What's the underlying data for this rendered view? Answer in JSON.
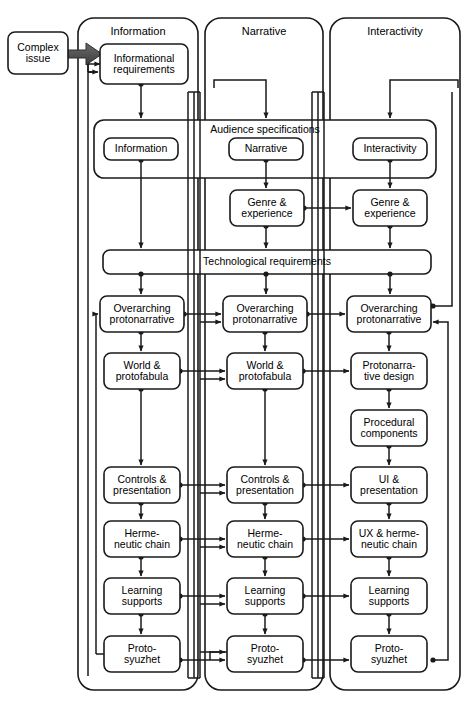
{
  "diagram": {
    "type": "flowchart",
    "source_node": {
      "id": "complex-issue",
      "label": "Complex\nissue",
      "x": 8,
      "y": 32,
      "w": 60,
      "h": 42
    },
    "source_arrow": {
      "name": "thick-gray-arrow",
      "color": "#555555",
      "from": "complex-issue",
      "to": "informational-requirements"
    },
    "columns": [
      {
        "id": "information",
        "label": "Information",
        "x": 78,
        "y": 18,
        "w": 120,
        "h": 672
      },
      {
        "id": "narrative",
        "label": "Narrative",
        "x": 205,
        "y": 18,
        "w": 118,
        "h": 672
      },
      {
        "id": "interactivity",
        "label": "Interactivity",
        "x": 330,
        "y": 18,
        "w": 130,
        "h": 672
      }
    ],
    "bands": [
      {
        "id": "audience-specifications",
        "label": "Audience specifications",
        "x": 94,
        "y": 120,
        "w": 342,
        "h": 58
      },
      {
        "id": "technological-requirements",
        "label": "Technological requirements",
        "x": 103,
        "y": 250,
        "w": 328,
        "h": 24
      }
    ],
    "nodes": [
      {
        "id": "informational-requirements",
        "col": "information",
        "label": "Informational\nrequirements",
        "x": 100,
        "y": 44,
        "w": 88,
        "h": 40
      },
      {
        "id": "aud-information",
        "col": "information",
        "label": "Information",
        "x": 104,
        "y": 138,
        "w": 74,
        "h": 22
      },
      {
        "id": "aud-narrative",
        "col": "narrative",
        "label": "Narrative",
        "x": 229,
        "y": 138,
        "w": 74,
        "h": 22
      },
      {
        "id": "aud-interactivity",
        "col": "interactivity",
        "label": "Interactivity",
        "x": 353,
        "y": 138,
        "w": 74,
        "h": 22
      },
      {
        "id": "genre-experience-narrative",
        "col": "narrative",
        "label": "Genre &\nexperience",
        "x": 230,
        "y": 190,
        "w": 74,
        "h": 36
      },
      {
        "id": "genre-experience-interactivity",
        "col": "interactivity",
        "label": "Genre &\nexperience",
        "x": 353,
        "y": 190,
        "w": 74,
        "h": 36
      },
      {
        "id": "overarching-protonarrative-information",
        "col": "information",
        "label": "Overarching\nprotonarrative",
        "x": 100,
        "y": 296,
        "w": 84,
        "h": 36
      },
      {
        "id": "overarching-protonarrative-narrative",
        "col": "narrative",
        "label": "Overarching\nprotonarrative",
        "x": 223,
        "y": 296,
        "w": 84,
        "h": 36
      },
      {
        "id": "overarching-protonarrative-interactivity",
        "col": "interactivity",
        "label": "Overarching\nprotonarrative",
        "x": 347,
        "y": 296,
        "w": 84,
        "h": 36
      },
      {
        "id": "world-protofabula-information",
        "col": "information",
        "label": "World &\nprotofabula",
        "x": 104,
        "y": 353,
        "w": 76,
        "h": 36
      },
      {
        "id": "world-protofabula-narrative",
        "col": "narrative",
        "label": "World &\nprotofabula",
        "x": 227,
        "y": 353,
        "w": 76,
        "h": 36
      },
      {
        "id": "protonarrative-design",
        "col": "interactivity",
        "label": "Protonarra-\ntive design",
        "x": 351,
        "y": 353,
        "w": 76,
        "h": 36
      },
      {
        "id": "procedural-components",
        "col": "interactivity",
        "label": "Procedural\ncomponents",
        "x": 351,
        "y": 410,
        "w": 76,
        "h": 36
      },
      {
        "id": "controls-presentation-information",
        "col": "information",
        "label": "Controls &\npresentation",
        "x": 104,
        "y": 467,
        "w": 76,
        "h": 36
      },
      {
        "id": "controls-presentation-narrative",
        "col": "narrative",
        "label": "Controls &\npresentation",
        "x": 227,
        "y": 467,
        "w": 76,
        "h": 36
      },
      {
        "id": "ui-presentation",
        "col": "interactivity",
        "label": "UI &\npresentation",
        "x": 351,
        "y": 467,
        "w": 76,
        "h": 36
      },
      {
        "id": "hermeneutic-chain-information",
        "col": "information",
        "label": "Herme-\nneutic chain",
        "x": 104,
        "y": 521,
        "w": 76,
        "h": 36
      },
      {
        "id": "hermeneutic-chain-narrative",
        "col": "narrative",
        "label": "Herme-\nneutic chain",
        "x": 227,
        "y": 521,
        "w": 76,
        "h": 36
      },
      {
        "id": "ux-hermeneutic-chain",
        "col": "interactivity",
        "label": "UX & herme-\nneutic chain",
        "x": 351,
        "y": 521,
        "w": 76,
        "h": 36
      },
      {
        "id": "learning-supports-information",
        "col": "information",
        "label": "Learning\nsupports",
        "x": 104,
        "y": 578,
        "w": 76,
        "h": 36
      },
      {
        "id": "learning-supports-narrative",
        "col": "narrative",
        "label": "Learning\nsupports",
        "x": 227,
        "y": 578,
        "w": 76,
        "h": 36
      },
      {
        "id": "learning-supports-interactivity",
        "col": "interactivity",
        "label": "Learning\nsupports",
        "x": 351,
        "y": 578,
        "w": 76,
        "h": 36
      },
      {
        "id": "proto-syuzhet-information",
        "col": "information",
        "label": "Proto-\nsyuzhet",
        "x": 104,
        "y": 636,
        "w": 76,
        "h": 36
      },
      {
        "id": "proto-syuzhet-narrative",
        "col": "narrative",
        "label": "Proto-\nsyuzhet",
        "x": 227,
        "y": 636,
        "w": 76,
        "h": 36
      },
      {
        "id": "proto-syuzhet-interactivity",
        "col": "interactivity",
        "label": "Proto-\nsyuzhet",
        "x": 351,
        "y": 636,
        "w": 76,
        "h": 36
      }
    ],
    "colors": {
      "stroke": "#1a1a1a",
      "fill": "#ffffff",
      "source_arrow": "#555555",
      "text": "#000000"
    }
  }
}
